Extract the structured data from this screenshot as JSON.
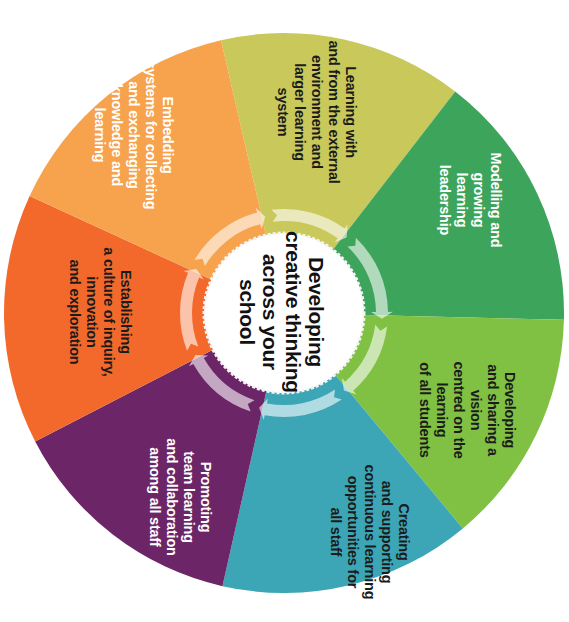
{
  "diagram": {
    "center": {
      "title": "Developing\ncreative thinking\nacross your\nschool"
    },
    "segments": [
      {
        "id": "external-learning",
        "label": "Learning with\nand from the external\nenvironment and\nlarger learning\nsystem",
        "color": "#c9c85a",
        "text_color": "dark",
        "start_angle": 257,
        "end_angle": 307.7
      },
      {
        "id": "leadership",
        "label": "Modelling and\ngrowing learning\nleadership",
        "color": "#3da45b",
        "text_color": "light",
        "start_angle": 307.7,
        "end_angle": 361.4
      },
      {
        "id": "shared-vision",
        "label": "Developing\nand sharing a vision\ncentred on the learning\nof all students",
        "color": "#80c143",
        "text_color": "dark",
        "start_angle": 1.4,
        "end_angle": 50.3
      },
      {
        "id": "continuous-learning",
        "label": "Creating\nand supporting\ncontinuous learning\nopportunities for\nall staff",
        "color": "#3ca6b6",
        "text_color": "dark",
        "start_angle": 50.3,
        "end_angle": 102.7
      },
      {
        "id": "team-learning",
        "label": "Promoting\nteam learning\nand collaboration\namong all staff",
        "color": "#6c2567",
        "text_color": "light",
        "start_angle": 102.7,
        "end_angle": 152.7
      },
      {
        "id": "culture-of-inquiry",
        "label": "Establishing\na culture of inquiry,\ninnovation\nand exploration",
        "color": "#f2692b",
        "text_color": "dark",
        "start_angle": 152.7,
        "end_angle": 204.7
      },
      {
        "id": "knowledge-systems",
        "label": "Embedding\nsystems for collecting\nand exchanging\nknowledge and\nlearning",
        "color": "#f7a24d",
        "text_color": "light",
        "start_angle": 204.7,
        "end_angle": 257
      }
    ],
    "colors": {
      "background": "#ffffff",
      "center_fill": "#ffffff",
      "arrow_ring": "#ffffff"
    }
  }
}
